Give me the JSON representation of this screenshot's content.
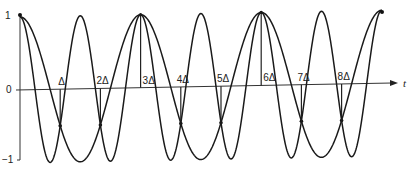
{
  "figure": {
    "y_axis": {
      "ticks": [
        {
          "label": "1",
          "value": 1
        },
        {
          "label": "0",
          "value": 0
        },
        {
          "label": "−1",
          "value": -1
        }
      ]
    },
    "x_axis": {
      "label": "t",
      "sample_labels": [
        "Δ",
        "2Δ",
        "3Δ",
        "4Δ",
        "5Δ",
        "6Δ",
        "7Δ",
        "8Δ"
      ]
    },
    "curves": [
      {
        "name": "low-frequency-cosine",
        "description": "cos(2πt/3Δ)",
        "period_in_delta": 3
      },
      {
        "name": "high-frequency-cosine",
        "description": "cos(4πt/3Δ)",
        "period_in_delta": 1.5
      }
    ],
    "t_range_in_delta": [
      0,
      9
    ],
    "sample_values": [
      1,
      -0.5,
      -0.5,
      1,
      -0.5,
      -0.5,
      1,
      -0.5,
      -0.5,
      1
    ]
  },
  "colors": {
    "line": "#1a1a1a",
    "background": "#ffffff"
  }
}
